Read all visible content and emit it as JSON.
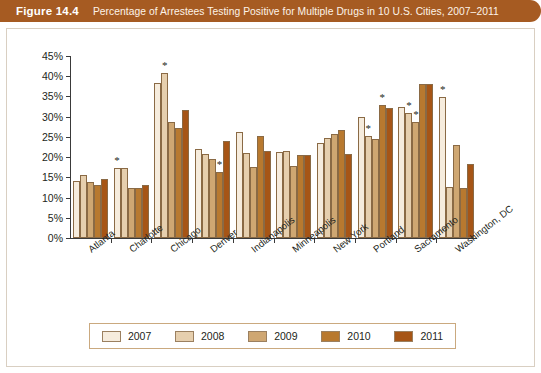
{
  "banner": {
    "figure_number": "Figure 14.4",
    "title": "Percentage of Arrestees Testing Positive for Multiple Drugs in 10 U.S. Cities, 2007–2011",
    "background_color": "#a65b22"
  },
  "chart_data": {
    "type": "bar",
    "title": "Percentage of Arrestees Testing Positive for Multiple Drugs in 10 U.S. Cities, 2007–2011",
    "xlabel": "",
    "ylabel": "",
    "ylim": [
      0,
      45
    ],
    "ytick_labels": [
      "0%",
      "5%",
      "10%",
      "15%",
      "20%",
      "25%",
      "30%",
      "35%",
      "40%",
      "45%"
    ],
    "ytick_values": [
      0,
      5,
      10,
      15,
      20,
      25,
      30,
      35,
      40,
      45
    ],
    "grid": false,
    "legend_position": "bottom",
    "categories": [
      "Atlanta",
      "Charlotte",
      "Chicago",
      "Denver",
      "Indianapolis",
      "Minneapolis",
      "New York",
      "Portland",
      "Sacramento",
      "Washington, DC"
    ],
    "series": [
      {
        "name": "2007",
        "color": "#f6ecdd",
        "values": [
          14.0,
          17.2,
          38.4,
          21.9,
          26.1,
          21.2,
          23.6,
          29.8,
          32.5,
          34.8
        ]
      },
      {
        "name": "2008",
        "color": "#e6cfae",
        "values": [
          15.5,
          17.2,
          40.8,
          20.7,
          21.0,
          21.6,
          24.7,
          25.3,
          31.0,
          12.6
        ]
      },
      {
        "name": "2009",
        "color": "#cfa772",
        "values": [
          13.8,
          12.4,
          28.7,
          19.6,
          17.6,
          17.8,
          25.8,
          24.4,
          28.6,
          23.0
        ]
      },
      {
        "name": "2010",
        "color": "#b8792f",
        "values": [
          13.2,
          12.3,
          27.3,
          16.3,
          25.3,
          20.5,
          26.8,
          33.0,
          38.2,
          12.3
        ]
      },
      {
        "name": "2011",
        "color": "#a65516",
        "values": [
          14.6,
          13.0,
          31.7,
          23.9,
          21.5,
          20.5,
          20.8,
          32.2,
          38.2,
          18.4
        ]
      }
    ],
    "annotations": [
      {
        "symbol": "*",
        "category": "Charlotte",
        "series": "2007",
        "value": 17.2
      },
      {
        "symbol": "*",
        "category": "Chicago",
        "series": "2008",
        "value": 40.8
      },
      {
        "symbol": "*",
        "category": "Denver",
        "series": "2010",
        "value": 16.3
      },
      {
        "symbol": "*",
        "category": "Portland",
        "series": "2008",
        "value": 25.3
      },
      {
        "symbol": "*",
        "category": "Portland",
        "series": "2010",
        "value": 33.0
      },
      {
        "symbol": "*",
        "category": "Sacramento",
        "series": "2008",
        "value": 31.0
      },
      {
        "symbol": "*",
        "category": "Sacramento",
        "series": "2009",
        "value": 28.6
      },
      {
        "symbol": "*",
        "category": "Washington, DC",
        "series": "2007",
        "value": 34.8
      }
    ]
  },
  "legend": {
    "items": [
      {
        "label": "2007",
        "color": "#f6ecdd"
      },
      {
        "label": "2008",
        "color": "#e6cfae"
      },
      {
        "label": "2009",
        "color": "#cfa772"
      },
      {
        "label": "2010",
        "color": "#b8792f"
      },
      {
        "label": "2011",
        "color": "#a65516"
      }
    ]
  }
}
